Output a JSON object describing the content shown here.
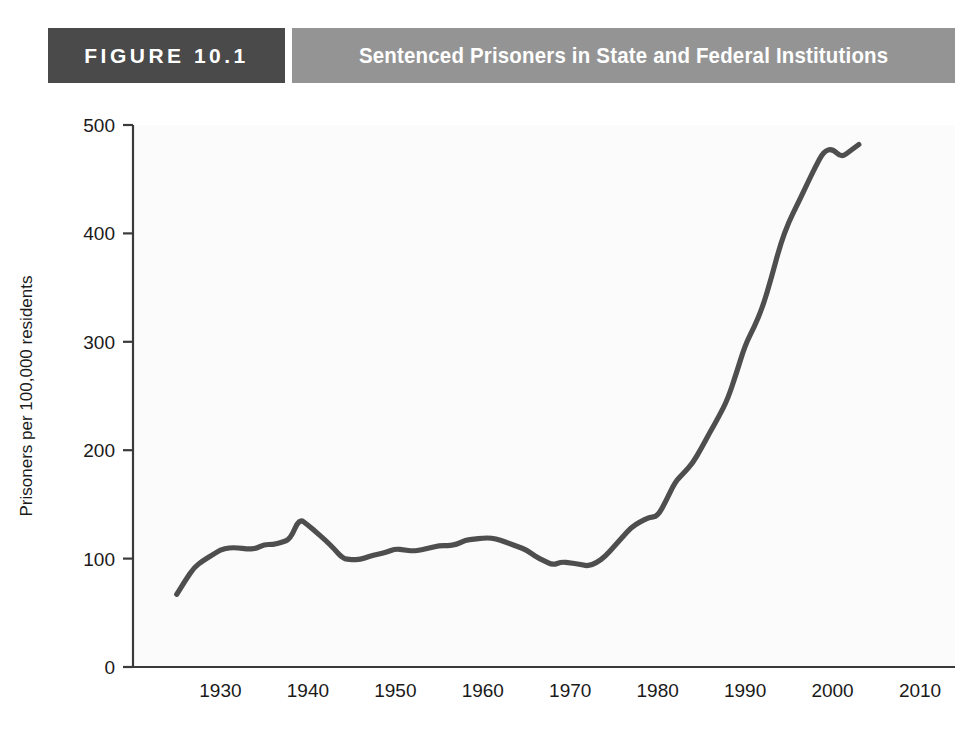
{
  "header": {
    "figure_number": "FIGURE 10.1",
    "title": "Sentenced Prisoners in State and Federal Institutions",
    "number_block_color": "#4a4a4a",
    "title_block_color": "#949494",
    "text_color": "#ffffff"
  },
  "chart_data": {
    "type": "line",
    "title": "Sentenced Prisoners in State and Federal Institutions",
    "xlabel": "",
    "ylabel": "Prisoners per 100,000 residents",
    "xlim": [
      1920,
      2014
    ],
    "ylim": [
      0,
      500
    ],
    "xticks": [
      1930,
      1940,
      1950,
      1960,
      1970,
      1980,
      1990,
      2000,
      2010
    ],
    "xtick_labels": [
      "1930",
      "1940",
      "1950",
      "1960",
      "1970",
      "1980",
      "1990",
      "2000",
      "2010"
    ],
    "yticks": [
      0,
      100,
      200,
      300,
      400,
      500
    ],
    "ytick_labels": [
      "0",
      "100",
      "200",
      "300",
      "400",
      "500"
    ],
    "grid": false,
    "legend": null,
    "line_color": "#4e4e4e",
    "series": [
      {
        "name": "Sentenced prisoners per 100,000 residents",
        "x": [
          1925,
          1926,
          1927,
          1928,
          1929,
          1930,
          1931,
          1932,
          1933,
          1934,
          1935,
          1936,
          1937,
          1938,
          1939,
          1940,
          1941,
          1942,
          1943,
          1944,
          1945,
          1946,
          1947,
          1948,
          1949,
          1950,
          1951,
          1952,
          1953,
          1954,
          1955,
          1956,
          1957,
          1958,
          1959,
          1960,
          1961,
          1962,
          1963,
          1964,
          1965,
          1966,
          1967,
          1968,
          1969,
          1970,
          1971,
          1972,
          1973,
          1974,
          1975,
          1976,
          1977,
          1978,
          1979,
          1980,
          1981,
          1982,
          1983,
          1984,
          1985,
          1986,
          1987,
          1988,
          1989,
          1990,
          1991,
          1992,
          1993,
          1994,
          1995,
          1996,
          1997,
          1998,
          1999,
          2000,
          2001,
          2002,
          2003
        ],
        "values": [
          67,
          80,
          92,
          98,
          103,
          108,
          110,
          110,
          109,
          109,
          113,
          113,
          115,
          118,
          137,
          131,
          124,
          117,
          109,
          100,
          99,
          99,
          102,
          104,
          106,
          109,
          108,
          107,
          108,
          110,
          112,
          112,
          113,
          117,
          118,
          119,
          119,
          117,
          114,
          111,
          108,
          102,
          98,
          94,
          97,
          96,
          95,
          93,
          96,
          102,
          111,
          120,
          129,
          134,
          138,
          139,
          154,
          171,
          179,
          188,
          202,
          217,
          231,
          247,
          271,
          297,
          313,
          332,
          359,
          389,
          411,
          427,
          444,
          461,
          476,
          478,
          470,
          476,
          482
        ]
      }
    ],
    "annotations": []
  },
  "layout": {
    "background": "#ffffff",
    "plot_background": "#fbfbfb",
    "axis_color": "#3a3a3a"
  }
}
